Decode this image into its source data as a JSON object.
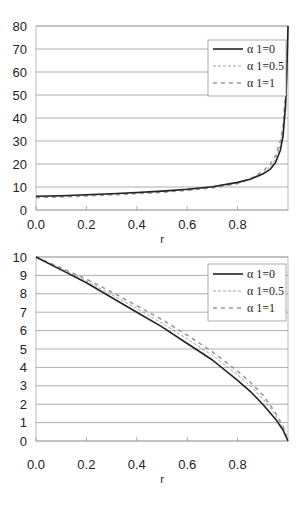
{
  "chart_data": [
    {
      "type": "line",
      "title": "",
      "xlabel": "r",
      "ylabel": "",
      "xlim": [
        0.0,
        1.0
      ],
      "ylim": [
        0,
        80
      ],
      "xticks": [
        "0.0",
        "0.2",
        "0.4",
        "0.6",
        "0.8"
      ],
      "yticks": [
        "0",
        "10",
        "20",
        "30",
        "40",
        "50",
        "60",
        "70",
        "80"
      ],
      "grid": "horizontal",
      "legend_position": "upper right",
      "x": [
        0.0,
        0.1,
        0.2,
        0.3,
        0.4,
        0.5,
        0.6,
        0.7,
        0.8,
        0.85,
        0.9,
        0.93,
        0.95,
        0.97,
        0.98,
        0.99,
        0.995,
        1.0
      ],
      "series": [
        {
          "name": "α 1=0",
          "style": "solid",
          "values": [
            6.0,
            6.2,
            6.6,
            7.1,
            7.6,
            8.2,
            9.0,
            10.1,
            12.0,
            13.4,
            15.6,
            17.8,
            20.5,
            26.0,
            32.0,
            45.0,
            58.0,
            80.0
          ]
        },
        {
          "name": "α 1=0.5",
          "style": "thin-dashed",
          "values": [
            5.7,
            6.0,
            6.4,
            6.9,
            7.4,
            8.0,
            8.8,
            9.9,
            11.8,
            13.5,
            16.2,
            19.0,
            22.0,
            28.0,
            34.0,
            48.0,
            62.0,
            80.0
          ]
        },
        {
          "name": "α 1=1",
          "style": "thick-dashed",
          "values": [
            5.4,
            5.7,
            6.1,
            6.6,
            7.1,
            7.7,
            8.5,
            9.6,
            11.5,
            13.6,
            16.8,
            20.0,
            23.5,
            30.0,
            36.0,
            51.0,
            66.0,
            75.0
          ]
        }
      ]
    },
    {
      "type": "line",
      "title": "",
      "xlabel": "r",
      "ylabel": "",
      "xlim": [
        0.0,
        1.0
      ],
      "ylim": [
        0,
        10
      ],
      "xticks": [
        "0.0",
        "0.2",
        "0.4",
        "0.6",
        "0.8"
      ],
      "yticks": [
        "0",
        "1",
        "2",
        "3",
        "4",
        "5",
        "6",
        "7",
        "8",
        "9",
        "10"
      ],
      "grid": "horizontal",
      "legend_position": "upper right",
      "x": [
        0.0,
        0.1,
        0.2,
        0.3,
        0.4,
        0.5,
        0.6,
        0.7,
        0.8,
        0.85,
        0.9,
        0.95,
        0.98,
        1.0
      ],
      "series": [
        {
          "name": "α 1=0",
          "style": "solid",
          "values": [
            10.0,
            9.3,
            8.6,
            7.8,
            7.0,
            6.2,
            5.3,
            4.4,
            3.3,
            2.7,
            2.0,
            1.2,
            0.6,
            0.0
          ]
        },
        {
          "name": "α 1=0.5",
          "style": "thin-dashed",
          "values": [
            10.0,
            9.35,
            8.7,
            7.95,
            7.2,
            6.4,
            5.55,
            4.65,
            3.6,
            3.0,
            2.3,
            1.4,
            0.7,
            0.0
          ]
        },
        {
          "name": "α 1=1",
          "style": "thick-dashed",
          "values": [
            10.0,
            9.4,
            8.8,
            8.1,
            7.35,
            6.6,
            5.75,
            4.85,
            3.8,
            3.2,
            2.5,
            1.55,
            0.8,
            0.0
          ]
        }
      ]
    }
  ],
  "charts": [
    {
      "xlabel": "r",
      "legend": [
        "α 1=0",
        "α 1=0.5",
        "α 1=1"
      ]
    },
    {
      "xlabel": "r",
      "legend": [
        "α 1=0",
        "α 1=0.5",
        "α 1=1"
      ]
    }
  ]
}
